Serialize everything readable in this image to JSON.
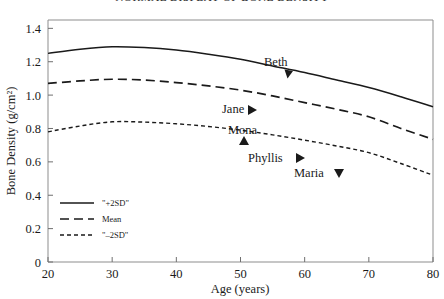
{
  "chart_data": {
    "type": "line",
    "title": "NORMAL DISPLAY OF BONE DENSITY",
    "xlabel": "Age (years)",
    "ylabel": "Bone Density (g/cm²)",
    "xlim": [
      20,
      80
    ],
    "ylim": [
      0,
      1.45
    ],
    "xticks": [
      "20",
      "30",
      "40",
      "50",
      "60",
      "70",
      "80"
    ],
    "xtick_values": [
      20,
      30,
      40,
      50,
      60,
      70,
      80
    ],
    "yticks": [
      "0",
      "0.2",
      "0.4",
      "0.6",
      "0.8",
      "1.0",
      "1.2",
      "1.4"
    ],
    "ytick_values": [
      0,
      0.2,
      0.4,
      0.6,
      0.8,
      1.0,
      1.2,
      1.4
    ],
    "grid": false,
    "legend_position": "lower-left-inside",
    "x": [
      20,
      25,
      30,
      35,
      40,
      45,
      50,
      55,
      60,
      65,
      70,
      75,
      80
    ],
    "series": [
      {
        "name": "\"+2SD\"",
        "style": "solid",
        "values": [
          1.25,
          1.275,
          1.29,
          1.285,
          1.27,
          1.245,
          1.215,
          1.175,
          1.135,
          1.09,
          1.045,
          0.99,
          0.93
        ]
      },
      {
        "name": "Mean",
        "style": "dashed",
        "values": [
          1.07,
          1.085,
          1.095,
          1.09,
          1.075,
          1.055,
          1.03,
          0.995,
          0.955,
          0.915,
          0.87,
          0.8,
          0.735
        ]
      },
      {
        "name": "\"–2SD\"",
        "style": "dotted",
        "values": [
          0.78,
          0.815,
          0.84,
          0.838,
          0.828,
          0.812,
          0.79,
          0.762,
          0.73,
          0.695,
          0.655,
          0.59,
          0.52
        ]
      }
    ],
    "annotations": [
      {
        "label": "Beth",
        "marker": "triangle-right-down",
        "label_x": 264,
        "label_y": 66,
        "marker_x": 288,
        "marker_y": 74
      },
      {
        "label": "Jane",
        "marker": "triangle-right",
        "label_x": 222,
        "label_y": 113,
        "marker_x": 252,
        "marker_y": 110
      },
      {
        "label": "Mona",
        "marker": "triangle-up",
        "label_x": 228,
        "label_y": 134,
        "marker_x": 244,
        "marker_y": 141
      },
      {
        "label": "Phyllis",
        "marker": "triangle-right",
        "label_x": 248,
        "label_y": 162,
        "marker_x": 300,
        "marker_y": 158
      },
      {
        "label": "Maria",
        "marker": "triangle-down",
        "label_x": 294,
        "label_y": 177,
        "marker_x": 339,
        "marker_y": 173
      }
    ],
    "legend_entries": [
      {
        "label": "\"+2SD\"",
        "style": "solid"
      },
      {
        "label": "Mean",
        "style": "dashed"
      },
      {
        "label": "\"–2SD\"",
        "style": "dotted"
      }
    ]
  }
}
